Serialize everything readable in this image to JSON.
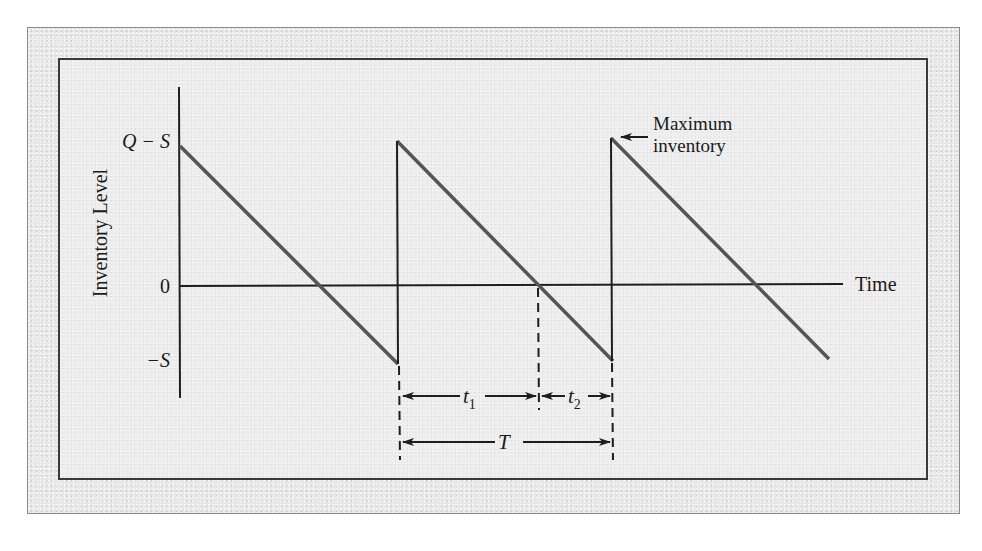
{
  "diagram": {
    "y_axis": {
      "label": "Inventory Level",
      "ticks": [
        {
          "label": "Q − S",
          "value": "Q-S"
        },
        {
          "label": "0",
          "value": 0
        },
        {
          "label": "−S",
          "value": "-S"
        }
      ]
    },
    "x_axis": {
      "label": "Time"
    },
    "annotations": {
      "max_inventory_line1": "Maximum",
      "max_inventory_line2": "inventory",
      "t1": "t",
      "t1_sub": "1",
      "t2": "t",
      "t2_sub": "2",
      "T": "T"
    },
    "series": {
      "name": "inventory sawtooth",
      "color": "#5a5a5a",
      "cycles": 3
    },
    "colors": {
      "axis": "#1e1e1e",
      "sawtooth": "#555555",
      "frame_outer": "#e6e6e6",
      "frame_inner": "#ececec"
    }
  }
}
